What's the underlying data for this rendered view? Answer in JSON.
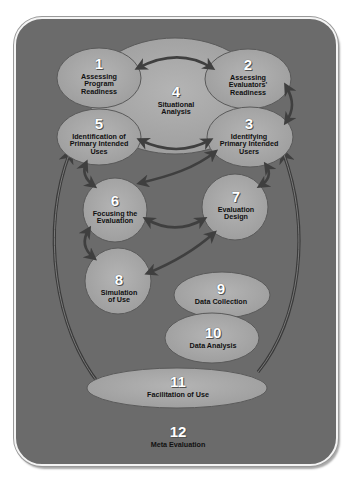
{
  "diagram": {
    "colors": {
      "frame_bg": "#6b6b6b",
      "frame_border": "#f4f4f4",
      "node_fill": "#a9a9a9",
      "node_stroke": "#5a5a5a",
      "arrow": "#3f3f3f",
      "number_text": "#ffffff",
      "label_text": "#111111"
    },
    "nodes": [
      {
        "id": "1",
        "number": "1",
        "label": "Assessing Program Readiness",
        "lines": [
          "Assessing",
          "Program",
          "Readiness"
        ]
      },
      {
        "id": "2",
        "number": "2",
        "label": "Assessing Evaluators' Readiness",
        "lines": [
          "Assessing",
          "Evaluators'",
          "Readiness"
        ]
      },
      {
        "id": "3",
        "number": "3",
        "label": "Identifying Primary Intended Users",
        "lines": [
          "Identifying",
          "Primary Intended",
          "Users"
        ]
      },
      {
        "id": "4",
        "number": "4",
        "label": "Situational Analysis",
        "lines": [
          "Situational",
          "Analysis"
        ]
      },
      {
        "id": "5",
        "number": "5",
        "label": "Identification of Primary Intended Uses",
        "lines": [
          "Identification of",
          "Primary Intended",
          "Uses"
        ]
      },
      {
        "id": "6",
        "number": "6",
        "label": "Focusing the Evaluation",
        "lines": [
          "Focusing the",
          "Evaluation"
        ]
      },
      {
        "id": "7",
        "number": "7",
        "label": "Evaluation Design",
        "lines": [
          "Evaluation",
          "Design"
        ]
      },
      {
        "id": "8",
        "number": "8",
        "label": "Simulation of Use",
        "lines": [
          "Simulation",
          "of Use"
        ]
      },
      {
        "id": "9",
        "number": "9",
        "label": "Data Collection",
        "lines": [
          "Data Collection"
        ]
      },
      {
        "id": "10",
        "number": "10",
        "label": "Data Analysis",
        "lines": [
          "Data Analysis"
        ]
      },
      {
        "id": "11",
        "number": "11",
        "label": "Facilitation of Use",
        "lines": [
          "Facilitation of Use"
        ]
      },
      {
        "id": "12",
        "number": "12",
        "label": "Meta Evaluation",
        "lines": [
          "Meta Evaluation"
        ]
      }
    ],
    "edges": [
      {
        "from": "1",
        "to": "2",
        "bidirectional": true
      },
      {
        "from": "2",
        "to": "3",
        "bidirectional": true
      },
      {
        "from": "5",
        "to": "3",
        "bidirectional": true
      },
      {
        "from": "3",
        "to": "6",
        "bidirectional": true
      },
      {
        "from": "5",
        "to": "6",
        "bidirectional": true
      },
      {
        "from": "3",
        "to": "7",
        "bidirectional": true
      },
      {
        "from": "6",
        "to": "7",
        "bidirectional": true
      },
      {
        "from": "6",
        "to": "8",
        "bidirectional": true
      },
      {
        "from": "7",
        "to": "8",
        "bidirectional": true
      },
      {
        "from": "11",
        "to": "5",
        "bidirectional": false
      },
      {
        "from": "11",
        "to": "3",
        "bidirectional": false
      }
    ]
  }
}
